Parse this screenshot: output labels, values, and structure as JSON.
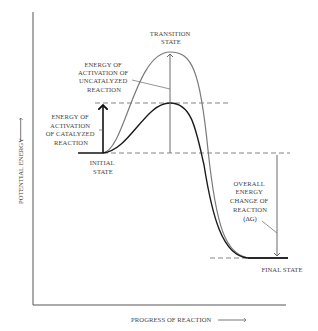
{
  "diagram": {
    "type": "energy-profile",
    "axes": {
      "y_label": "POTENTIAL ENERGY",
      "x_label": "PROGRESS OF REACTION"
    },
    "labels": {
      "transition_state": [
        "TRANSITION",
        "STATE"
      ],
      "uncatalyzed_activation": [
        "ENERGY OF",
        "ACTIVATION OF",
        "UNCATALYZED",
        "REACTION"
      ],
      "catalyzed_activation": [
        "ENERGY OF",
        "ACTIVATION",
        "OF CATALYZED",
        "REACTION"
      ],
      "initial_state": [
        "INITIAL",
        "STATE"
      ],
      "overall_energy_change": [
        "OVERALL",
        "ENERGY",
        "CHANGE OF",
        "REACTION",
        "(ΔG)"
      ],
      "final_state": "FINAL STATE"
    },
    "curves": [
      {
        "name": "uncatalyzed",
        "color": "#7a7a7a"
      },
      {
        "name": "catalyzed",
        "color": "#1a1a1a"
      }
    ],
    "colors": {
      "axis": "#555555",
      "dash": "#777777",
      "arrow_gray": "#6a6a6a",
      "arrow_black": "#111111"
    }
  }
}
